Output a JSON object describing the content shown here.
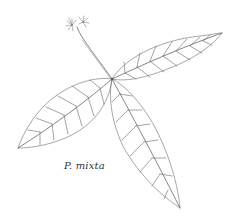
{
  "figure": {
    "caption": "P. mixta",
    "colors": {
      "background": "#ffffff",
      "line": "#555555",
      "caption": "#333333"
    }
  }
}
